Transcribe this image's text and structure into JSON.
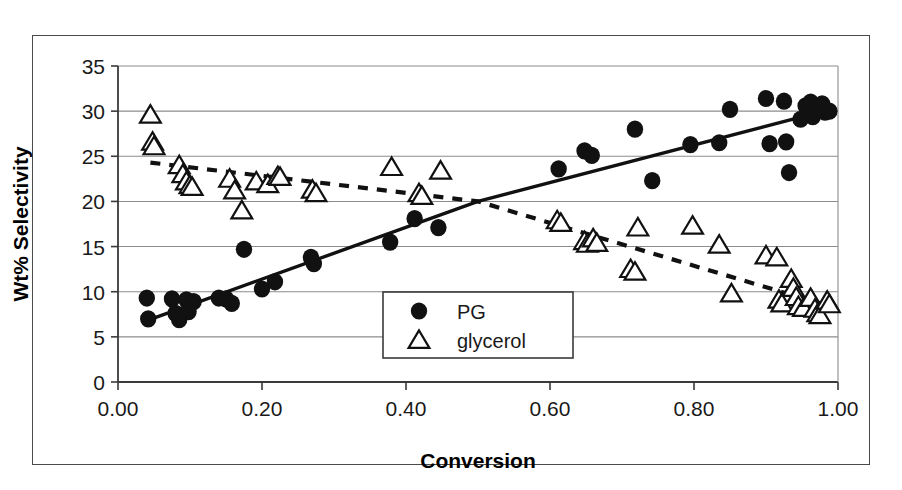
{
  "figure": {
    "background_color": "#ffffff",
    "frame_color": "#4a4a4a",
    "series_color": "#111111"
  },
  "chart_data": {
    "type": "scatter",
    "title": "",
    "subtitle": "",
    "xlabel": "Conversion",
    "ylabel": "Wt% Selectivity",
    "xlim": [
      0.0,
      1.0
    ],
    "ylim": [
      0,
      35
    ],
    "xticks": [
      0.0,
      0.2,
      0.4,
      0.6,
      0.8,
      1.0
    ],
    "xticklabels": [
      "0.00",
      "0.20",
      "0.40",
      "0.60",
      "0.80",
      "1.00"
    ],
    "yticks": [
      0,
      5,
      10,
      15,
      20,
      25,
      30,
      35
    ],
    "yticklabels": [
      "0",
      "5",
      "10",
      "15",
      "20",
      "25",
      "30",
      "35"
    ],
    "grid": "horizontal",
    "legend_position": "center",
    "series": [
      {
        "name": "PG",
        "marker": "filled-circle",
        "color": "#111111",
        "trendline": {
          "style": "solid",
          "points": [
            [
              0.04,
              6.8
            ],
            [
              0.5,
              20.0
            ],
            [
              0.98,
              30.0
            ]
          ]
        },
        "points": [
          [
            0.04,
            9.3
          ],
          [
            0.042,
            7.0
          ],
          [
            0.075,
            9.2
          ],
          [
            0.08,
            7.6
          ],
          [
            0.085,
            6.9
          ],
          [
            0.095,
            9.1
          ],
          [
            0.098,
            7.8
          ],
          [
            0.105,
            8.9
          ],
          [
            0.14,
            9.3
          ],
          [
            0.15,
            9.2
          ],
          [
            0.158,
            8.7
          ],
          [
            0.175,
            14.7
          ],
          [
            0.2,
            10.3
          ],
          [
            0.218,
            11.1
          ],
          [
            0.268,
            13.8
          ],
          [
            0.272,
            13.1
          ],
          [
            0.378,
            15.5
          ],
          [
            0.412,
            18.1
          ],
          [
            0.445,
            17.1
          ],
          [
            0.612,
            23.6
          ],
          [
            0.648,
            25.6
          ],
          [
            0.658,
            25.1
          ],
          [
            0.718,
            28.0
          ],
          [
            0.742,
            22.3
          ],
          [
            0.795,
            26.3
          ],
          [
            0.835,
            26.5
          ],
          [
            0.85,
            30.2
          ],
          [
            0.9,
            31.4
          ],
          [
            0.905,
            26.4
          ],
          [
            0.925,
            31.1
          ],
          [
            0.928,
            26.6
          ],
          [
            0.932,
            23.2
          ],
          [
            0.948,
            29.1
          ],
          [
            0.955,
            30.6
          ],
          [
            0.962,
            31.0
          ],
          [
            0.965,
            29.4
          ],
          [
            0.972,
            30.3
          ],
          [
            0.978,
            30.8
          ],
          [
            0.982,
            29.9
          ],
          [
            0.988,
            30.0
          ]
        ]
      },
      {
        "name": "glycerol",
        "marker": "open-triangle",
        "color": "#111111",
        "trendline": {
          "style": "dashed",
          "points": [
            [
              0.045,
              24.3
            ],
            [
              0.5,
              20.0
            ],
            [
              0.98,
              8.6
            ]
          ]
        },
        "points": [
          [
            0.045,
            29.6
          ],
          [
            0.048,
            26.6
          ],
          [
            0.05,
            26.1
          ],
          [
            0.085,
            24.0
          ],
          [
            0.09,
            23.0
          ],
          [
            0.095,
            22.2
          ],
          [
            0.1,
            21.8
          ],
          [
            0.103,
            21.6
          ],
          [
            0.155,
            22.5
          ],
          [
            0.162,
            21.2
          ],
          [
            0.172,
            19.0
          ],
          [
            0.192,
            22.2
          ],
          [
            0.208,
            21.9
          ],
          [
            0.222,
            22.8
          ],
          [
            0.225,
            22.7
          ],
          [
            0.27,
            21.3
          ],
          [
            0.275,
            20.9
          ],
          [
            0.38,
            23.8
          ],
          [
            0.418,
            20.9
          ],
          [
            0.422,
            20.6
          ],
          [
            0.448,
            23.4
          ],
          [
            0.61,
            17.9
          ],
          [
            0.615,
            17.6
          ],
          [
            0.648,
            15.6
          ],
          [
            0.652,
            15.3
          ],
          [
            0.66,
            15.9
          ],
          [
            0.665,
            15.4
          ],
          [
            0.712,
            12.5
          ],
          [
            0.718,
            12.2
          ],
          [
            0.722,
            17.1
          ],
          [
            0.798,
            17.3
          ],
          [
            0.835,
            15.2
          ],
          [
            0.852,
            9.8
          ],
          [
            0.9,
            14.0
          ],
          [
            0.915,
            13.8
          ],
          [
            0.918,
            9.1
          ],
          [
            0.922,
            8.7
          ],
          [
            0.935,
            11.4
          ],
          [
            0.938,
            10.4
          ],
          [
            0.942,
            9.4
          ],
          [
            0.945,
            8.4
          ],
          [
            0.952,
            8.2
          ],
          [
            0.962,
            9.3
          ],
          [
            0.968,
            8.1
          ],
          [
            0.972,
            7.6
          ],
          [
            0.975,
            7.4
          ],
          [
            0.985,
            9.0
          ],
          [
            0.988,
            8.6
          ]
        ]
      }
    ]
  },
  "legend": {
    "items": [
      {
        "label": "PG",
        "marker": "filled-circle"
      },
      {
        "label": "glycerol",
        "marker": "open-triangle"
      }
    ]
  }
}
